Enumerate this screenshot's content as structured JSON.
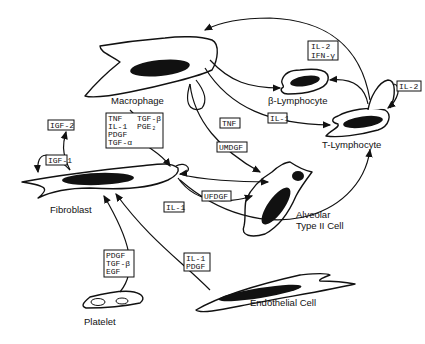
{
  "diagram": {
    "cells": {
      "macrophage": "Macrophage",
      "b_lymphocyte": "β-Lymphocyte",
      "t_lymphocyte": "T-Lymphocyte",
      "fibroblast": "Fibroblast",
      "alveolar_1": "Alveolar",
      "alveolar_2": "Type II Cell",
      "endothelial": "Endothelial Cell",
      "platelet": "Platelet"
    },
    "factors": {
      "il2_ifn": [
        "IL-2",
        "IFN-γ"
      ],
      "il2_t": "IL-2",
      "il1_t": "IL-1",
      "tnf": "TNF",
      "umdgf": "UMDGF",
      "ufdgf": "UFDGF",
      "il1_fib": "IL-1",
      "igf2": "IGF-2",
      "igf1": "IGF-1",
      "macrophage_box": [
        "TNF",
        "TGF-β",
        "IL-1",
        "PGE₂",
        "PDGF",
        "TGF-α"
      ],
      "platelet_box": [
        "PDGF",
        "TGF-β",
        "EGF"
      ],
      "endothelial_box": [
        "IL-1",
        "PDGF"
      ]
    }
  }
}
